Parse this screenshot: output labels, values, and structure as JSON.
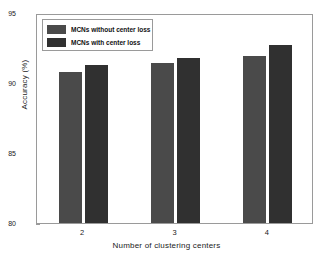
{
  "chart_data": {
    "type": "bar",
    "title": "",
    "xlabel": "Number of clustering centers",
    "ylabel": "Accuracy (%)",
    "categories": [
      "2",
      "3",
      "4"
    ],
    "series": [
      {
        "name": "MCNs without center loss",
        "color": "#4a4a4a",
        "values": [
          90.8,
          91.4,
          91.9
        ]
      },
      {
        "name": "MCNs with center loss",
        "color": "#303030",
        "values": [
          91.3,
          91.8,
          92.7
        ]
      }
    ],
    "ylim": [
      80,
      95
    ],
    "yticks": [
      80,
      85,
      90,
      95
    ],
    "ytick_labels": [
      "80",
      "85",
      "90",
      "95"
    ],
    "grid": false,
    "legend_position": "top-left-inside",
    "background": "#ffffff",
    "axis_color": "#9a9a9a"
  }
}
